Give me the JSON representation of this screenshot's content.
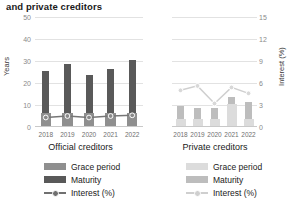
{
  "title": "and private creditors",
  "axes": {
    "left": {
      "label": "Years",
      "ticks": [
        "0",
        "10",
        "20",
        "30",
        "40",
        "50"
      ],
      "min": 0,
      "max": 50
    },
    "right": {
      "label": "Interest (%)",
      "ticks": [
        "0",
        "3",
        "6",
        "9",
        "12",
        "15"
      ],
      "min": 0,
      "max": 15
    }
  },
  "panels": [
    {
      "id": "official",
      "label": "Official creditors"
    },
    {
      "id": "private",
      "label": "Private creditors"
    }
  ],
  "legend": {
    "official": [
      {
        "name": "Grace period",
        "type": "bar",
        "color": "#8f8f8f"
      },
      {
        "name": "Maturity",
        "type": "bar",
        "color": "#595959"
      },
      {
        "name": "Interest (%)",
        "type": "line",
        "color": "#707070"
      }
    ],
    "private": [
      {
        "name": "Grace period",
        "type": "bar",
        "color": "#dcdcdc"
      },
      {
        "name": "Maturity",
        "type": "bar",
        "color": "#bdbdbd"
      },
      {
        "name": "Interest (%)",
        "type": "line",
        "color": "#cfcfcf"
      }
    ]
  },
  "chart_data": [
    {
      "type": "bar",
      "title": "Official creditors",
      "categories": [
        "2018",
        "2019",
        "2020",
        "2021",
        "2022"
      ],
      "xlabel": "",
      "ylabel": "Years",
      "ylim": [
        0,
        50
      ],
      "y2label": "Interest (%)",
      "y2lim": [
        0,
        15
      ],
      "grid": true,
      "legend_position": "below",
      "series": [
        {
          "name": "Maturity",
          "axis": "left",
          "type": "bar",
          "values": [
            25,
            28,
            23,
            26,
            30
          ]
        },
        {
          "name": "Grace period",
          "axis": "left",
          "type": "bar",
          "values": [
            6,
            6,
            6,
            6,
            6
          ]
        },
        {
          "name": "Interest (%)",
          "axis": "right",
          "type": "line",
          "values": [
            1.3,
            1.5,
            1.3,
            1.5,
            1.6
          ]
        }
      ]
    },
    {
      "type": "bar",
      "title": "Private creditors",
      "categories": [
        "2018",
        "2019",
        "2020",
        "2021",
        "2022"
      ],
      "xlabel": "",
      "ylabel": "Years",
      "ylim": [
        0,
        50
      ],
      "y2label": "Interest (%)",
      "y2lim": [
        0,
        15
      ],
      "grid": true,
      "legend_position": "below",
      "series": [
        {
          "name": "Maturity",
          "axis": "left",
          "type": "bar",
          "values": [
            9,
            8,
            8,
            13,
            11
          ]
        },
        {
          "name": "Grace period",
          "axis": "left",
          "type": "bar",
          "values": [
            3,
            3,
            3,
            10,
            3
          ]
        },
        {
          "name": "Interest (%)",
          "axis": "right",
          "type": "line",
          "values": [
            5.0,
            5.6,
            3.2,
            5.4,
            4.6
          ]
        }
      ]
    }
  ]
}
